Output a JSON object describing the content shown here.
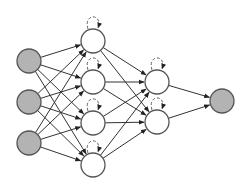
{
  "diagram": {
    "type": "recurrent-neural-network",
    "colors": {
      "background": "#ffffff",
      "edge": "#333333",
      "node_stroke": "#555555",
      "io_fill": "#b3b3b3",
      "hidden_fill": "#ffffff",
      "loop": "#666666"
    },
    "node_radius": 12,
    "layers": [
      {
        "name": "input",
        "kind": "io",
        "nodes": [
          [
            29,
            61
          ],
          [
            29,
            102
          ],
          [
            29,
            143
          ]
        ]
      },
      {
        "name": "hidden-1",
        "kind": "hidden",
        "recurrent": true,
        "nodes": [
          [
            93,
            41
          ],
          [
            93,
            82
          ],
          [
            93,
            123
          ],
          [
            93,
            165
          ]
        ]
      },
      {
        "name": "hidden-2",
        "kind": "hidden",
        "recurrent": true,
        "nodes": [
          [
            157,
            82
          ],
          [
            157,
            122
          ]
        ]
      },
      {
        "name": "output",
        "kind": "io",
        "nodes": [
          [
            222,
            101
          ]
        ]
      }
    ]
  }
}
